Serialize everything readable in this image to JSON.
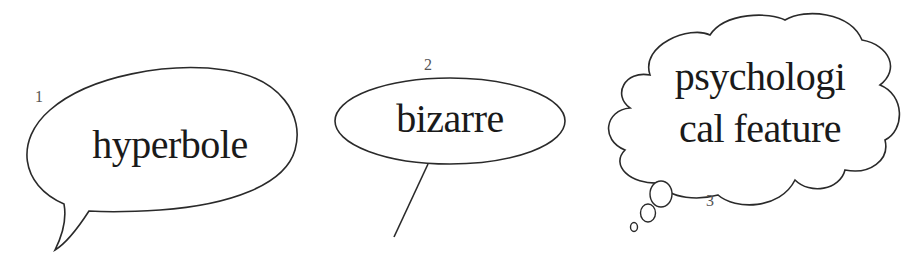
{
  "callouts": [
    {
      "number": "1",
      "text": "hyperbole",
      "shape": "speech-bubble-oval"
    },
    {
      "number": "2",
      "text": "bizarre",
      "shape": "oval-with-line-pointer"
    },
    {
      "number": "3",
      "text_line1": "psychologi",
      "text_line2": "cal feature",
      "shape": "thought-cloud"
    }
  ],
  "colors": {
    "stroke": "#2a2a2a",
    "background": "#ffffff"
  }
}
